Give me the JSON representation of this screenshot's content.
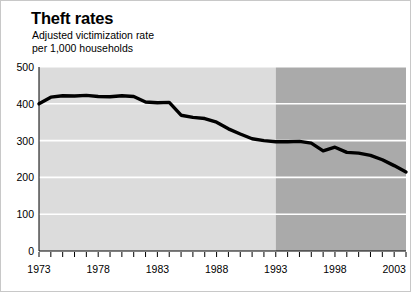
{
  "chart_data": {
    "type": "line",
    "title": "Theft rates",
    "subtitle": "Adjusted victimization rate\nper 1,000 households",
    "xlabel": "",
    "ylabel": "",
    "ylim": [
      0,
      500
    ],
    "xlim": [
      1973,
      2004
    ],
    "ytick_labels": [
      "0",
      "100",
      "200",
      "300",
      "400",
      "500"
    ],
    "yticks": [
      0,
      100,
      200,
      300,
      400,
      500
    ],
    "xtick_labels": [
      "1973",
      "1978",
      "1983",
      "1988",
      "1993",
      "1998",
      "2003"
    ],
    "xticks": [
      1973,
      1978,
      1983,
      1988,
      1993,
      1998,
      2003
    ],
    "grid": "horizontal-white",
    "legend": "none",
    "series": [
      {
        "name": "Adjusted victimization rate per 1,000 households",
        "color": "#000000",
        "x": [
          1973,
          1974,
          1975,
          1976,
          1977,
          1978,
          1979,
          1980,
          1981,
          1982,
          1983,
          1984,
          1985,
          1986,
          1987,
          1988,
          1989,
          1990,
          1991,
          1992,
          1993,
          1994,
          1995,
          1996,
          1997,
          1998,
          1999,
          2000,
          2001,
          2002,
          2003,
          2004
        ],
        "values": [
          400,
          418,
          422,
          421,
          423,
          420,
          419,
          422,
          420,
          405,
          403,
          404,
          369,
          363,
          360,
          350,
          332,
          318,
          305,
          300,
          297,
          297,
          298,
          293,
          272,
          282,
          268,
          266,
          260,
          248,
          232,
          215
        ]
      }
    ],
    "shaded_regions": [
      {
        "name": "pre-1993",
        "from": 1973,
        "to": 1993,
        "color": "#dcdcdc"
      },
      {
        "name": "post-1993-redesign",
        "from": 1993,
        "to": 2004,
        "color": "#aaaaaa"
      }
    ]
  },
  "header": {
    "title": "Theft rates",
    "subtitle": "Adjusted victimization rate\nper 1,000 households"
  },
  "axis": {
    "y_labels": [
      "500",
      "400",
      "300",
      "200",
      "100",
      "0"
    ],
    "x_labels": [
      "1973",
      "1978",
      "1983",
      "1988",
      "1993",
      "1998",
      "2003"
    ]
  },
  "colors": {
    "line": "#000000",
    "panel_light": "#dcdcdc",
    "panel_dark": "#aaaaaa",
    "gridline": "#ffffff",
    "axis": "#000000",
    "text": "#000000"
  }
}
